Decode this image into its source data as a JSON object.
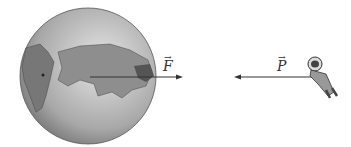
{
  "diagram": {
    "earth": {
      "label": "Earth",
      "color": "#8a8a8a"
    },
    "force_earth": {
      "symbol": "F",
      "vector": true,
      "direction": "right"
    },
    "force_astronaut": {
      "symbol": "P",
      "vector": true,
      "direction": "left"
    },
    "astronaut": {
      "label": "astronaut"
    }
  }
}
